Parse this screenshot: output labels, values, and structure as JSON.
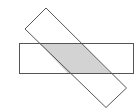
{
  "diagram": {
    "shapes": [
      {
        "name": "horizontal-rectangle",
        "fill": "#ffffff",
        "stroke": "#555555"
      },
      {
        "name": "rotated-rectangle",
        "fill": "none",
        "stroke": "#555555"
      },
      {
        "name": "overlap-region",
        "fill": "#d3d3d3"
      }
    ]
  }
}
